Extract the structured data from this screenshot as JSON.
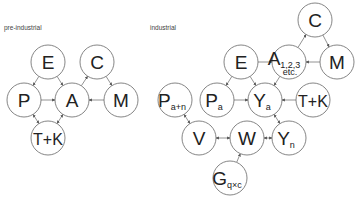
{
  "labels": {
    "pre_industrial": "pre-industrial",
    "industrial": "industrial"
  },
  "pre_industrial": {
    "nodes": [
      {
        "id": "E",
        "main": "E",
        "sub": "",
        "x": 48,
        "y": 62
      },
      {
        "id": "C",
        "main": "C",
        "sub": "",
        "x": 97,
        "y": 62
      },
      {
        "id": "P",
        "main": "P",
        "sub": "",
        "x": 24,
        "y": 100
      },
      {
        "id": "A",
        "main": "A",
        "sub": "",
        "x": 72,
        "y": 100
      },
      {
        "id": "M",
        "main": "M",
        "sub": "",
        "x": 121,
        "y": 100
      },
      {
        "id": "TK",
        "main": "T+K",
        "sub": "",
        "x": 48,
        "y": 138
      }
    ],
    "edges": [
      {
        "from": "E",
        "to": "P"
      },
      {
        "from": "E",
        "to": "A"
      },
      {
        "from": "A",
        "to": "C"
      },
      {
        "from": "C",
        "to": "M"
      },
      {
        "from": "M",
        "to": "A"
      },
      {
        "from": "P",
        "to": "A"
      },
      {
        "from": "P",
        "to": "TK",
        "both": true
      },
      {
        "from": "A",
        "to": "TK",
        "both": true
      }
    ]
  },
  "industrial": {
    "nodes": [
      {
        "id": "C",
        "main": "C",
        "sub": "",
        "x": 315,
        "y": 20
      },
      {
        "id": "E",
        "main": "E",
        "sub": "",
        "x": 241,
        "y": 62
      },
      {
        "id": "A",
        "main": "A",
        "sub": "1,2,3",
        "sub2": "etc.",
        "x": 289,
        "y": 62
      },
      {
        "id": "M",
        "main": "M",
        "sub": "",
        "x": 337,
        "y": 62
      },
      {
        "id": "Pan",
        "main": "P",
        "sub": "a+n",
        "x": 175,
        "y": 100
      },
      {
        "id": "Pa",
        "main": "P",
        "sub": "a",
        "x": 217,
        "y": 100
      },
      {
        "id": "Ya",
        "main": "Y",
        "sub": "a",
        "x": 265,
        "y": 100
      },
      {
        "id": "TK",
        "main": "T+K",
        "sub": "",
        "x": 313,
        "y": 100
      },
      {
        "id": "V",
        "main": "V",
        "sub": "",
        "x": 199,
        "y": 138
      },
      {
        "id": "W",
        "main": "W",
        "sub": "",
        "x": 247,
        "y": 138
      },
      {
        "id": "Yn",
        "main": "Y",
        "sub": "n",
        "x": 289,
        "y": 138
      },
      {
        "id": "G",
        "main": "G",
        "sub": "q×c",
        "x": 230,
        "y": 178
      }
    ],
    "edges": [
      {
        "from": "E",
        "to": "A"
      },
      {
        "from": "A",
        "to": "C"
      },
      {
        "from": "C",
        "to": "M"
      },
      {
        "from": "M",
        "to": "A"
      },
      {
        "from": "E",
        "to": "Pa"
      },
      {
        "from": "E",
        "to": "Ya"
      },
      {
        "from": "A",
        "to": "Ya"
      },
      {
        "from": "Pa",
        "to": "Ya"
      },
      {
        "from": "TK",
        "to": "Ya"
      },
      {
        "from": "Ya",
        "to": "Yn",
        "both": true
      },
      {
        "from": "Pan",
        "to": "V",
        "both": true
      },
      {
        "from": "W",
        "to": "V",
        "both": true
      },
      {
        "from": "Yn",
        "to": "W",
        "both": true
      },
      {
        "from": "G",
        "to": "W"
      }
    ]
  },
  "style": {
    "radius": 17,
    "stroke": "#666666",
    "text": "#222222"
  }
}
